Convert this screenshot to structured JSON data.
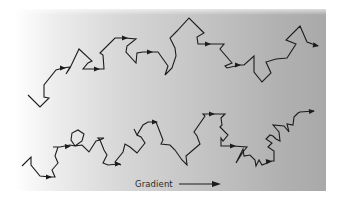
{
  "figure": {
    "title": "",
    "legend": {
      "label": "Gradient",
      "direction": "left-to-right"
    },
    "background": {
      "type": "horizontal-gradient",
      "from_color": "#ffffff",
      "to_color": "#a9a9a9"
    },
    "stroke_color": "#1c1c1c",
    "walks": [
      {
        "name": "top-walk",
        "points": [
          [
            28,
            95
          ],
          [
            40,
            107
          ],
          [
            49,
            98
          ],
          [
            44,
            97
          ],
          [
            44,
            85
          ],
          [
            56,
            70
          ],
          [
            63,
            68
          ],
          [
            70,
            67
          ],
          [
            66,
            74
          ],
          [
            70,
            68
          ],
          [
            79,
            49
          ],
          [
            92,
            61
          ],
          [
            88,
            63
          ],
          [
            83,
            69
          ],
          [
            100,
            69
          ],
          [
            104,
            69
          ],
          [
            103,
            55
          ],
          [
            100,
            53
          ],
          [
            115,
            38
          ],
          [
            125,
            38
          ],
          [
            136,
            39
          ],
          [
            127,
            46
          ],
          [
            126,
            52
          ],
          [
            136,
            63
          ],
          [
            137,
            53
          ],
          [
            143,
            52
          ],
          [
            152,
            52
          ],
          [
            158,
            52
          ],
          [
            168,
            66
          ],
          [
            165,
            75
          ],
          [
            172,
            68
          ],
          [
            176,
            56
          ],
          [
            175,
            48
          ],
          [
            170,
            38
          ],
          [
            177,
            31
          ],
          [
            189,
            18
          ],
          [
            204,
            33
          ],
          [
            197,
            37
          ],
          [
            198,
            44
          ],
          [
            210,
            44
          ],
          [
            224,
            44
          ],
          [
            220,
            49
          ],
          [
            232,
            63
          ],
          [
            225,
            66
          ],
          [
            227,
            68
          ],
          [
            240,
            65
          ],
          [
            244,
            65
          ],
          [
            254,
            56
          ],
          [
            254,
            72
          ],
          [
            262,
            82
          ],
          [
            271,
            73
          ],
          [
            266,
            62
          ],
          [
            276,
            59
          ],
          [
            287,
            58
          ],
          [
            296,
            44
          ],
          [
            286,
            40
          ],
          [
            300,
            26
          ],
          [
            307,
            42
          ],
          [
            318,
            46
          ]
        ],
        "arrows": [
          [
            56,
            68,
            66,
            68
          ],
          [
            90,
            69,
            100,
            69
          ],
          [
            118,
            38,
            128,
            38
          ],
          [
            143,
            52,
            153,
            52
          ],
          [
            200,
            44,
            211,
            44
          ],
          [
            230,
            65,
            241,
            65
          ],
          [
            308,
            44,
            319,
            46
          ]
        ]
      },
      {
        "name": "bottom-walk",
        "points": [
          [
            22,
            166
          ],
          [
            31,
            157
          ],
          [
            31,
            165
          ],
          [
            40,
            176
          ],
          [
            50,
            177
          ],
          [
            55,
            177
          ],
          [
            52,
            170
          ],
          [
            58,
            163
          ],
          [
            55,
            156
          ],
          [
            58,
            147
          ],
          [
            53,
            147
          ],
          [
            60,
            147
          ],
          [
            70,
            145
          ],
          [
            75,
            146
          ],
          [
            71,
            140
          ],
          [
            72,
            133
          ],
          [
            78,
            130
          ],
          [
            84,
            134
          ],
          [
            82,
            141
          ],
          [
            75,
            146
          ],
          [
            82,
            145
          ],
          [
            89,
            152
          ],
          [
            96,
            141
          ],
          [
            100,
            140
          ],
          [
            98,
            138
          ],
          [
            104,
            138
          ],
          [
            100,
            140
          ],
          [
            104,
            150
          ],
          [
            107,
            155
          ],
          [
            103,
            163
          ],
          [
            108,
            165
          ],
          [
            118,
            164
          ],
          [
            121,
            165
          ],
          [
            115,
            162
          ],
          [
            123,
            152
          ],
          [
            125,
            144
          ],
          [
            130,
            147
          ],
          [
            137,
            153
          ],
          [
            145,
            143
          ],
          [
            141,
            137
          ],
          [
            137,
            135
          ],
          [
            134,
            129
          ],
          [
            137,
            135
          ],
          [
            143,
            125
          ],
          [
            148,
            122
          ],
          [
            156,
            122
          ],
          [
            158,
            127
          ],
          [
            163,
            140
          ],
          [
            161,
            144
          ],
          [
            170,
            145
          ],
          [
            175,
            150
          ],
          [
            182,
            160
          ],
          [
            187,
            165
          ],
          [
            186,
            156
          ],
          [
            200,
            144
          ],
          [
            197,
            136
          ],
          [
            194,
            132
          ],
          [
            205,
            116
          ],
          [
            203,
            114
          ],
          [
            209,
            114
          ],
          [
            225,
            114
          ],
          [
            221,
            118
          ],
          [
            222,
            125
          ],
          [
            220,
            127
          ],
          [
            228,
            135
          ],
          [
            223,
            141
          ],
          [
            221,
            138
          ],
          [
            221,
            146
          ],
          [
            233,
            146
          ],
          [
            247,
            147
          ],
          [
            243,
            152
          ],
          [
            236,
            163
          ],
          [
            243,
            149
          ],
          [
            244,
            156
          ],
          [
            250,
            155
          ],
          [
            255,
            160
          ],
          [
            256,
            166
          ],
          [
            259,
            160
          ],
          [
            262,
            165
          ],
          [
            272,
            161
          ],
          [
            274,
            161
          ],
          [
            274,
            151
          ],
          [
            268,
            147
          ],
          [
            272,
            143
          ],
          [
            266,
            139
          ],
          [
            270,
            135
          ],
          [
            273,
            136
          ],
          [
            276,
            139
          ],
          [
            280,
            141
          ],
          [
            279,
            132
          ],
          [
            273,
            125
          ],
          [
            284,
            126
          ],
          [
            289,
            132
          ],
          [
            287,
            124
          ],
          [
            293,
            125
          ],
          [
            294,
            117
          ],
          [
            298,
            113
          ],
          [
            300,
            112
          ],
          [
            314,
            111
          ]
        ],
        "arrows": [
          [
            42,
            177,
            52,
            177
          ],
          [
            60,
            147,
            71,
            146
          ],
          [
            111,
            164,
            121,
            164
          ],
          [
            148,
            122,
            158,
            122
          ],
          [
            205,
            114,
            215,
            114
          ],
          [
            226,
            146,
            236,
            146
          ],
          [
            262,
            162,
            272,
            161
          ],
          [
            303,
            112,
            315,
            111
          ]
        ]
      }
    ]
  }
}
